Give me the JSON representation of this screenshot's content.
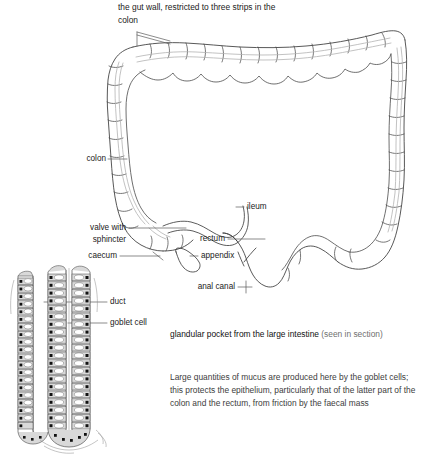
{
  "figure": {
    "line_color": "#3a3a3a",
    "taenia_color": "#b0b0b0",
    "cell_fill": "#d9d9d9",
    "nucleus_color": "#111111",
    "background": "#ffffff"
  },
  "top_note": {
    "text": "the gut wall, restricted\nto three strips in the\ncolon"
  },
  "labels": {
    "colon": "colon",
    "valve_with_sphincter": "valve with\nsphincter",
    "caecum": "caecum",
    "ileum": "ileum",
    "rectum": "rectum",
    "appendix": "appendix",
    "anal_canal": "anal canal",
    "duct": "duct",
    "goblet_cell": "goblet cell"
  },
  "captions": {
    "gland_caption_main": "glandular pocket from the large intestine ",
    "gland_caption_dim": "(seen in section)",
    "body_text": "Large quantities of mucus are produced here by the goblet cells; this protects the epithelium, particularly that of the latter part of the colon and the rectum, from friction by the faecal mass"
  }
}
